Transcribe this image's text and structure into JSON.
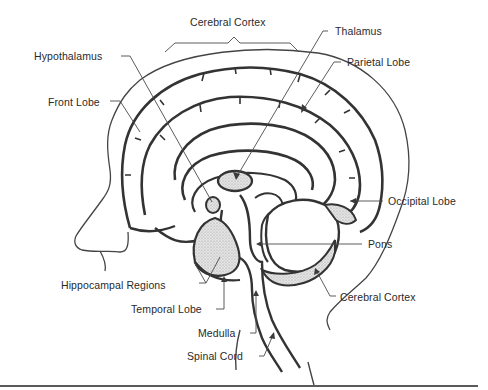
{
  "diagram": {
    "colors": {
      "outline": "#3a3a3a",
      "leader_line": "#4a4a4a",
      "shading": "#cfcfcf",
      "text": "#2a2a2a",
      "background": "#ffffff"
    },
    "labels": [
      {
        "id": "cerebral-cortex-top",
        "text": "Cerebral Cortex",
        "x": 190,
        "y": 22
      },
      {
        "id": "thalamus",
        "text": "Thalamus",
        "x": 335,
        "y": 31
      },
      {
        "id": "hypothalamus",
        "text": "Hypothalamus",
        "x": 34,
        "y": 51
      },
      {
        "id": "parietal-lobe",
        "text": "Parietal Lobe",
        "x": 347,
        "y": 56
      },
      {
        "id": "front-lobe",
        "text": "Front Lobe",
        "x": 48,
        "y": 97
      },
      {
        "id": "occipital-lobe",
        "text": "Occipital Lobe",
        "x": 388,
        "y": 196
      },
      {
        "id": "pons",
        "text": "Pons",
        "x": 368,
        "y": 238
      },
      {
        "id": "hippocampal-regions",
        "text": "Hippocampal Regions",
        "x": 61,
        "y": 281
      },
      {
        "id": "cerebral-cortex-bottom",
        "text": "Cerebral Cortex",
        "x": 340,
        "y": 292
      },
      {
        "id": "temporal-lobe",
        "text": "Temporal Lobe",
        "x": 131,
        "y": 304
      },
      {
        "id": "medulla",
        "text": "Medulla",
        "x": 198,
        "y": 328
      },
      {
        "id": "spinal-cord",
        "text": "Spinal Cord",
        "x": 187,
        "y": 351
      }
    ]
  }
}
